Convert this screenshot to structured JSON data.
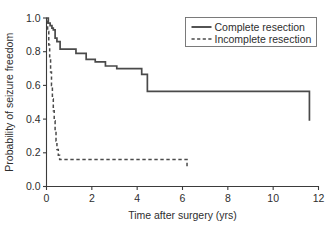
{
  "chart_data": {
    "type": "line",
    "title": "",
    "xlabel": "Time after surgery (yrs)",
    "ylabel": "Probability of seizure freedom",
    "xlim": [
      0,
      12
    ],
    "ylim": [
      0.0,
      1.0
    ],
    "xticks": [
      0,
      2,
      4,
      6,
      8,
      10,
      12
    ],
    "xtick_labels": [
      "0",
      "2",
      "4",
      "6",
      "8",
      "10",
      "12"
    ],
    "yticks": [
      0.0,
      0.2,
      0.4,
      0.6,
      0.8,
      1.0
    ],
    "ytick_labels": [
      "0.0",
      "0.2",
      "0.4",
      "0.6",
      "0.8",
      "1.0"
    ],
    "grid": false,
    "legend_position": "top-right",
    "step_style": "post",
    "series": [
      {
        "name": "Complete resection",
        "style": "solid",
        "color": "#4a4a4a",
        "x": [
          0.0,
          0.08,
          0.16,
          0.24,
          0.3,
          0.38,
          0.46,
          0.6,
          0.9,
          1.3,
          1.75,
          2.15,
          2.6,
          3.1,
          4.2,
          4.45,
          11.6
        ],
        "y": [
          1.0,
          0.97,
          0.955,
          0.94,
          0.93,
          0.88,
          0.86,
          0.815,
          0.815,
          0.79,
          0.755,
          0.74,
          0.715,
          0.7,
          0.665,
          0.565,
          0.39
        ]
      },
      {
        "name": "Incomplete resection",
        "style": "dashed",
        "color": "#4a4a4a",
        "x": [
          0.0,
          0.05,
          0.1,
          0.14,
          0.18,
          0.22,
          0.26,
          0.3,
          0.34,
          0.38,
          0.42,
          0.46,
          0.52,
          0.58,
          2.05,
          6.2
        ],
        "y": [
          0.98,
          0.92,
          0.84,
          0.76,
          0.68,
          0.6,
          0.52,
          0.45,
          0.39,
          0.33,
          0.27,
          0.22,
          0.185,
          0.16,
          0.16,
          0.11
        ]
      }
    ],
    "legend": [
      {
        "label": "Complete resection",
        "style": "solid"
      },
      {
        "label": "Incomplete resection",
        "style": "dashed"
      }
    ]
  },
  "colors": {
    "axis": "#3b3b3b",
    "series": "#4a4a4a",
    "legend_border": "#6d6d6d",
    "background": "#ffffff"
  }
}
